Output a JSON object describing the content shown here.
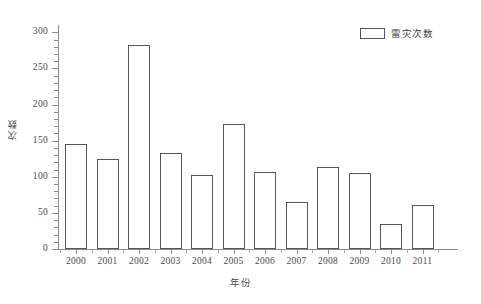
{
  "chart_data": {
    "type": "bar",
    "title": "",
    "xlabel": "年份",
    "ylabel": "次数",
    "categories": [
      "2000",
      "2001",
      "2002",
      "2003",
      "2004",
      "2005",
      "2006",
      "2007",
      "2008",
      "2009",
      "2010",
      "2011"
    ],
    "values": [
      146,
      124,
      283,
      133,
      102,
      173,
      106,
      65,
      113,
      105,
      34,
      61
    ],
    "series": [
      {
        "name": "雷灾次数",
        "values": [
          146,
          124,
          283,
          133,
          102,
          173,
          106,
          65,
          113,
          105,
          34,
          61
        ]
      }
    ],
    "ylim": [
      0,
      310
    ],
    "yticks": [
      0,
      50,
      100,
      150,
      200,
      250,
      300
    ],
    "ytick_labels": [
      "0",
      "50",
      "100",
      "150",
      "200",
      "250",
      "300"
    ],
    "y_minor_tick_step": 10,
    "grid": false,
    "legend": {
      "position": "top-right",
      "entries": [
        "雷灾次数"
      ]
    },
    "bar_style": {
      "fill": "#ffffff",
      "edge": "#555555"
    }
  },
  "legend": {
    "label": "雷灾次数"
  },
  "axes": {
    "x_title": "年份",
    "y_title": "次数"
  },
  "colors": {
    "axis": "#8d8d8d",
    "bar_edge": "#555555",
    "bar_fill": "#ffffff",
    "text": "#4a4a4a",
    "background": "#ffffff"
  }
}
